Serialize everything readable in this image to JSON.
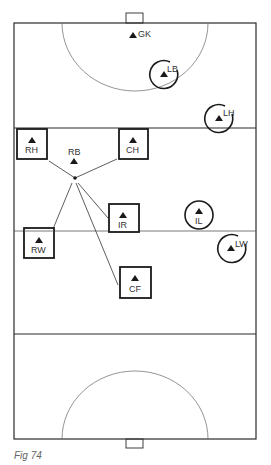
{
  "figure": {
    "caption": "Fig 74",
    "colors": {
      "line": "#2a2a2a",
      "thin_line": "#555555",
      "marker": "#1a1a1a",
      "text": "#333333"
    }
  },
  "pitch": {
    "left": 14,
    "right": 256,
    "top": 23,
    "bottom": 439,
    "top_23m_line_y": 128,
    "halfway_line_y": 231,
    "bottom_23m_line_y": 334,
    "top_goal": {
      "x": 126,
      "y": 13,
      "w": 17,
      "h": 10
    },
    "bottom_goal": {
      "x": 126,
      "y": 439,
      "w": 17,
      "h": 9
    },
    "top_d": {
      "cx": 135,
      "cy": 23,
      "rx": 73,
      "ry": 68
    },
    "bottom_d": {
      "cx": 135,
      "cy": 439,
      "rx": 73,
      "ry": 68
    }
  },
  "players": {
    "gk": {
      "label": "GK",
      "x": 133,
      "y": 37,
      "marker": "none"
    },
    "lb": {
      "label": "LB",
      "x": 164,
      "y": 75,
      "marker": "circle"
    },
    "lh": {
      "label": "LH",
      "x": 219,
      "y": 119,
      "marker": "circle"
    },
    "rh": {
      "label": "RH",
      "x": 32,
      "y": 144,
      "marker": "box"
    },
    "ch": {
      "label": "CH",
      "x": 133,
      "y": 144,
      "marker": "box"
    },
    "rb": {
      "label": "RB",
      "x": 74,
      "y": 162,
      "marker": "none"
    },
    "ir": {
      "label": "IR",
      "x": 124,
      "y": 218,
      "marker": "box"
    },
    "il": {
      "label": "IL",
      "x": 199,
      "y": 215,
      "marker": "circle"
    },
    "rw": {
      "label": "RW",
      "x": 39,
      "y": 243,
      "marker": "box"
    },
    "lw": {
      "label": "LW",
      "x": 232,
      "y": 248,
      "marker": "circle"
    },
    "cf": {
      "label": "CF",
      "x": 135,
      "y": 282,
      "marker": "box"
    }
  },
  "passing_lines": {
    "origin": {
      "x": 75,
      "y": 178
    },
    "targets": [
      "RH",
      "CH",
      "RW",
      "IR",
      "CF"
    ]
  }
}
